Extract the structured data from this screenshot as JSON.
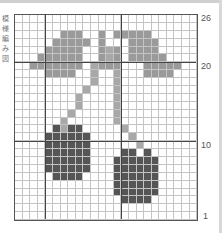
{
  "chart": {
    "columns": 24,
    "rows": 26,
    "row_labels": [
      {
        "label": "26",
        "row": 26
      },
      {
        "label": "20",
        "row": 20
      },
      {
        "label": "10",
        "row": 10
      },
      {
        "label": "1",
        "row": 1
      }
    ],
    "colors": {
      "leaf": "#9a9a9a",
      "stem": "#a8a8a8",
      "fruit": "#555555",
      "grid": "#c4c4c4",
      "heavy": "#444444"
    },
    "side_text": "模様編み図"
  },
  "chart_data": {
    "type": "heatmap",
    "xlabel": "",
    "ylabel": "Row",
    "row_ticks": [
      1,
      10,
      20,
      26
    ],
    "grid": true,
    "legend": [
      "leaf (gray)",
      "stem (light gray)",
      "cherry (dark gray)"
    ],
    "cells": {
      "leaf": {
        "24": [
          6,
          7,
          8,
          11,
          13,
          14,
          15,
          16,
          17
        ],
        "23": [
          5,
          6,
          7,
          8,
          9,
          11,
          15,
          16,
          17,
          18
        ],
        "22": [
          4,
          5,
          6,
          7,
          8,
          11,
          13,
          15,
          16,
          17,
          18
        ],
        "21": [
          3,
          4,
          5,
          6,
          7,
          8,
          11,
          13,
          15,
          16,
          17,
          18,
          19
        ],
        "20": [
          2,
          3,
          4,
          5,
          6,
          7,
          8,
          11,
          12,
          13,
          17,
          18,
          19,
          20,
          21
        ],
        "19": [
          4,
          5,
          6,
          7,
          17,
          18,
          19,
          20
        ]
      },
      "stem": {
        "22": [
          12
        ],
        "21": [
          12
        ],
        "20": [
          10
        ],
        "19": [
          10,
          13
        ],
        "18": [
          10,
          13
        ],
        "17": [
          9,
          13
        ],
        "16": [
          8,
          13
        ],
        "15": [
          8,
          13
        ],
        "14": [
          7,
          13
        ],
        "13": [
          6,
          13
        ],
        "12": [
          6,
          14
        ],
        "11": [
          15
        ],
        "10": [
          16
        ]
      },
      "fruit": {
        "12": [
          5,
          7,
          8
        ],
        "11": [
          4,
          5,
          6,
          7,
          8,
          9
        ],
        "10": [
          4,
          5,
          6,
          7,
          8,
          9
        ],
        "9": [
          4,
          5,
          6,
          7,
          8,
          9,
          14,
          15,
          17
        ],
        "8": [
          4,
          5,
          6,
          7,
          8,
          9,
          13,
          14,
          15,
          16,
          17,
          18
        ],
        "7": [
          4,
          5,
          6,
          7,
          8,
          9,
          13,
          14,
          15,
          16,
          17,
          18
        ],
        "6": [
          5,
          6,
          7,
          8,
          13,
          14,
          15,
          16,
          17,
          18
        ],
        "5": [
          13,
          14,
          15,
          16,
          17,
          18
        ],
        "4": [
          13,
          14,
          15,
          16,
          17,
          18
        ],
        "3": [
          14,
          15,
          16,
          17
        ]
      }
    }
  }
}
